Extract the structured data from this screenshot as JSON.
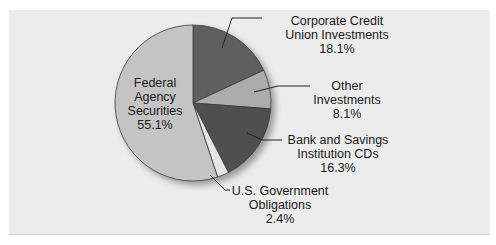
{
  "chart_data": {
    "type": "pie",
    "title": "",
    "start_angle": "12 o'clock",
    "direction": "clockwise",
    "categories": [
      "Corporate Credit Union Investments",
      "Other Investments",
      "Bank and Savings Institution CDs",
      "U.S. Government Obligations",
      "Federal Agency Securities"
    ],
    "values": [
      18.1,
      8.1,
      16.3,
      2.4,
      55.1
    ],
    "unit": "%",
    "colors": [
      "#5f5f5f",
      "#acacac",
      "#505050",
      "#e6e6e6",
      "#c4c4c4"
    ],
    "legend": "none (callout labels)"
  },
  "labels": {
    "corporate": {
      "line1": "Corporate Credit",
      "line2": "Union Investments",
      "pct": "18.1%"
    },
    "other": {
      "line1": "Other",
      "line2": "Investments",
      "pct": "8.1%"
    },
    "bank": {
      "line1": "Bank and Savings",
      "line2": "Institution CDs",
      "pct": "16.3%"
    },
    "usgov": {
      "line1": "U.S. Government",
      "line2": "Obligations",
      "pct": "2.4%"
    },
    "federal": {
      "line1": "Federal",
      "line2": "Agency",
      "line3": "Securities",
      "pct": "55.1%"
    }
  }
}
